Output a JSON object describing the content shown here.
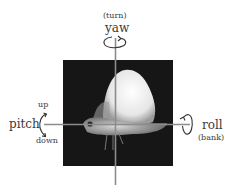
{
  "diagram": {
    "labels": {
      "yaw": "yaw",
      "yaw_sub": "(turn)",
      "pitch": "pitch",
      "pitch_up": "up",
      "pitch_down": "down",
      "roll": "roll",
      "roll_sub": "(bank)"
    },
    "nodes": [
      {
        "id": "photo",
        "kind": "image",
        "subject": "moth in flight, side view"
      },
      {
        "id": "yaw-axis",
        "kind": "vertical-axis"
      },
      {
        "id": "pitch-roll-axis",
        "kind": "horizontal-axis"
      }
    ],
    "colors": {
      "background": "#ffffff",
      "photo_bg": "#161616",
      "axis_line": "#8c8c8c",
      "text": "#3a3a3a",
      "moth_wing": "#eeeeee"
    }
  }
}
